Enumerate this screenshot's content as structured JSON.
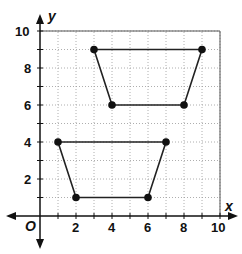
{
  "diagram": {
    "type": "coordinate-plane",
    "axes": {
      "x_label": "x",
      "y_label": "y",
      "origin_label": "O",
      "x_range": [
        0,
        10
      ],
      "y_range": [
        0,
        10
      ],
      "x_ticks": [
        "2",
        "4",
        "6",
        "8",
        "10"
      ],
      "y_ticks": [
        "2",
        "4",
        "6",
        "8",
        "10"
      ],
      "grid": "dotted, unit spacing"
    },
    "shapes": [
      {
        "name": "upper-trapezoid",
        "vertices": [
          [
            3,
            9
          ],
          [
            9,
            9
          ],
          [
            8,
            6
          ],
          [
            4,
            6
          ]
        ]
      },
      {
        "name": "lower-trapezoid",
        "vertices": [
          [
            1,
            4
          ],
          [
            7,
            4
          ],
          [
            6,
            1
          ],
          [
            2,
            1
          ]
        ]
      }
    ]
  }
}
